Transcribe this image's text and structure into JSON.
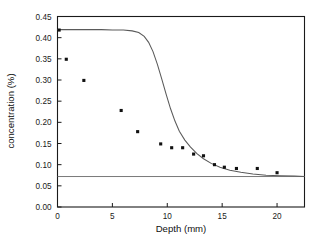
{
  "chart_data": {
    "type": "scatter",
    "title": "",
    "xlabel": "Depth (mm)",
    "ylabel": "concentration (%)",
    "xlim": [
      0,
      22.5
    ],
    "ylim": [
      0.0,
      0.45
    ],
    "xticks": [
      0,
      5,
      10,
      15,
      20
    ],
    "xtick_labels": [
      "0",
      "5",
      "10",
      "15",
      "20"
    ],
    "yticks": [
      0.0,
      0.05,
      0.1,
      0.15,
      0.2,
      0.25,
      0.3,
      0.35,
      0.4,
      0.45
    ],
    "ytick_labels": [
      "0.00",
      "0.05",
      "0.10",
      "0.15",
      "0.20",
      "0.25",
      "0.30",
      "0.35",
      "0.40",
      "0.45"
    ],
    "grid": false,
    "legend": null,
    "series": [
      {
        "name": "measured concentration",
        "type": "scatter",
        "marker": "square",
        "color": "#111111",
        "x": [
          0.15,
          0.8,
          2.4,
          5.8,
          7.3,
          9.4,
          10.4,
          11.4,
          12.4,
          13.3,
          14.3,
          15.2,
          16.3,
          18.2,
          20.0
        ],
        "y": [
          0.418,
          0.349,
          0.299,
          0.228,
          0.178,
          0.149,
          0.14,
          0.14,
          0.125,
          0.121,
          0.1,
          0.094,
          0.091,
          0.091,
          0.081
        ]
      },
      {
        "name": "fitted model curve",
        "type": "line",
        "color": "#5a5a5a",
        "x": [
          0.0,
          1.0,
          2.0,
          3.0,
          4.0,
          5.0,
          6.0,
          6.8,
          7.4,
          7.9,
          8.3,
          8.7,
          9.1,
          9.5,
          9.9,
          10.3,
          10.7,
          11.1,
          11.6,
          12.1,
          12.7,
          13.3,
          14.0,
          14.8,
          15.7,
          16.7,
          17.8,
          19.0,
          20.3,
          21.6,
          22.5
        ],
        "y": [
          0.419,
          0.419,
          0.419,
          0.419,
          0.419,
          0.418,
          0.418,
          0.416,
          0.412,
          0.403,
          0.389,
          0.367,
          0.337,
          0.302,
          0.266,
          0.232,
          0.203,
          0.179,
          0.158,
          0.142,
          0.126,
          0.114,
          0.103,
          0.094,
          0.087,
          0.082,
          0.078,
          0.075,
          0.074,
          0.073,
          0.072
        ]
      },
      {
        "name": "baseline reference",
        "type": "hline",
        "color": "#6b6b6b",
        "y": 0.072
      }
    ]
  },
  "axes": {
    "x_title": "Depth (mm)",
    "y_title": "concentration (%)"
  }
}
